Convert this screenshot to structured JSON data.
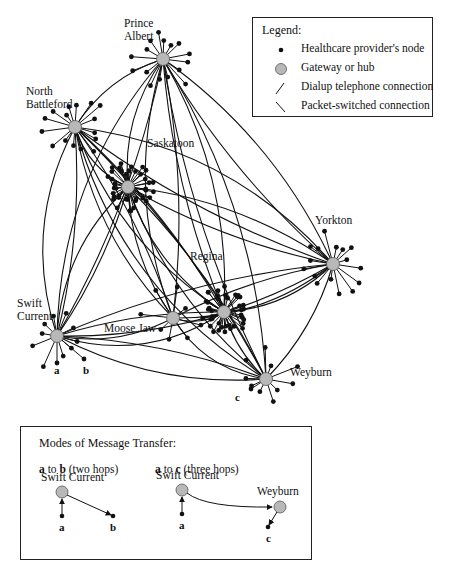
{
  "legend": {
    "title": "Legend:",
    "items": [
      {
        "icon": "node-dot-icon",
        "label": "Healthcare provider's node"
      },
      {
        "icon": "gateway-hub-icon",
        "label": "Gateway or hub"
      },
      {
        "icon": "dialup-line-icon",
        "label": "Dialup telephone connection"
      },
      {
        "icon": "packet-line-icon",
        "label": "Packet-switched connection"
      }
    ]
  },
  "hubs": [
    {
      "id": "prince_albert",
      "label_line1": "Prince",
      "label_line2": "Albert",
      "x": 163,
      "y": 59,
      "clients": 16
    },
    {
      "id": "north_battleford",
      "label_line1": "North",
      "label_line2": "Battleford",
      "x": 75,
      "y": 127,
      "clients": 16
    },
    {
      "id": "saskatoon",
      "label_line1": "Saskatoon",
      "label_line2": "",
      "x": 128,
      "y": 187,
      "clients": 40
    },
    {
      "id": "yorkton",
      "label_line1": "Yorkton",
      "label_line2": "",
      "x": 333,
      "y": 264,
      "clients": 16
    },
    {
      "id": "regina",
      "label_line1": "Regina",
      "label_line2": "",
      "x": 224,
      "y": 312,
      "clients": 40
    },
    {
      "id": "moose_jaw",
      "label_line1": "Moose Jaw",
      "label_line2": "",
      "x": 173,
      "y": 318,
      "clients": 8
    },
    {
      "id": "swift_current",
      "label_line1": "Swift",
      "label_line2": "Current",
      "x": 57,
      "y": 336,
      "clients": 10
    },
    {
      "id": "weyburn",
      "label_line1": "Weyburn",
      "label_line2": "",
      "x": 266,
      "y": 379,
      "clients": 10
    }
  ],
  "point_labels": {
    "a": "a",
    "b": "b",
    "c": "c"
  },
  "modes": {
    "title": "Modes of Message Transfer:",
    "example1": {
      "from": "a",
      "to_word": "to",
      "dest": "b",
      "hops": "(two hops)",
      "hub": "Swift Current",
      "start": "a",
      "end": "b"
    },
    "example2": {
      "from": "a",
      "to_word": "to",
      "dest": "c",
      "hops": "(three hops)",
      "hub1": "Swift Current",
      "hub2": "Weyburn",
      "start": "a",
      "end": "c"
    }
  },
  "colors": {
    "hub_fill": "#b8b8b8",
    "line": "#111111",
    "node": "#111111"
  }
}
